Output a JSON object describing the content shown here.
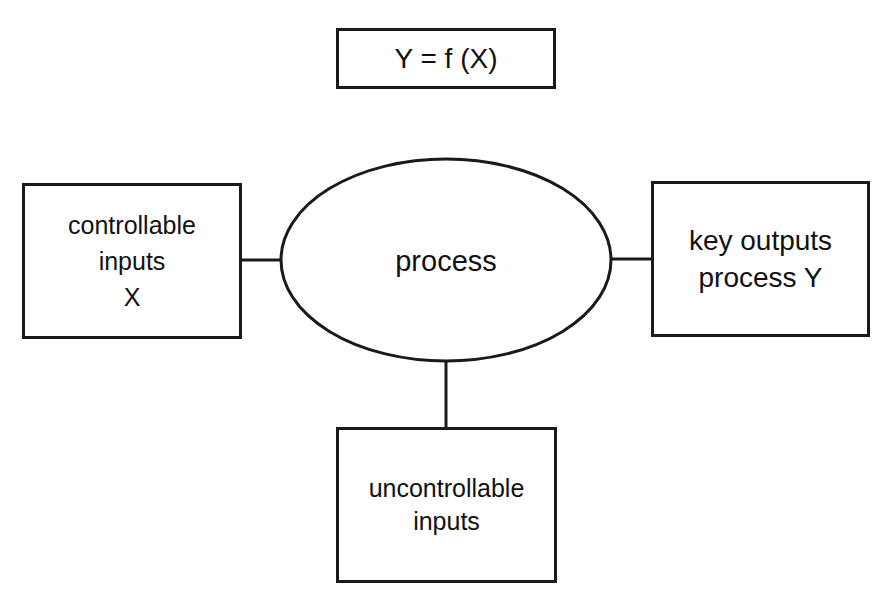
{
  "diagram": {
    "formula": "Y = f (X)",
    "nodes": {
      "controllable_inputs": {
        "lines": [
          "controllable",
          "inputs",
          "X"
        ]
      },
      "process": {
        "label": "process"
      },
      "key_outputs": {
        "lines": [
          "key outputs",
          "process Y"
        ]
      },
      "uncontrollable_inputs": {
        "lines": [
          "uncontrollable",
          "inputs"
        ]
      }
    },
    "edges": [
      {
        "from": "controllable_inputs",
        "to": "process"
      },
      {
        "from": "process",
        "to": "key_outputs"
      },
      {
        "from": "uncontrollable_inputs",
        "to": "process"
      }
    ],
    "colors": {
      "stroke": "#1a1a1a",
      "background": "#ffffff",
      "text": "#111111"
    }
  }
}
